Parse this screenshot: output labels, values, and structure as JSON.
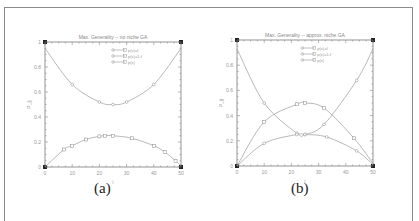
{
  "chart_data": [
    {
      "type": "line",
      "panel_label": "(a)",
      "title": "Max. Generality -- no niche GA",
      "xlabel": "t",
      "ylabel": "P_ij",
      "xlim": [
        0,
        50
      ],
      "ylim": [
        0,
        1
      ],
      "xticks": [
        0,
        10,
        20,
        30,
        40,
        50
      ],
      "yticks": [
        0,
        0.2,
        0.4,
        0.6,
        0.8,
        1
      ],
      "legend": [
        "p(x)=f",
        "p(x)=1-f",
        "p(x)"
      ],
      "series": [
        {
          "name": "upper curve",
          "marker": "circle",
          "x": [
            0,
            10,
            20,
            25,
            30,
            40,
            50
          ],
          "y": [
            0.95,
            0.66,
            0.52,
            0.5,
            0.52,
            0.66,
            0.95
          ]
        },
        {
          "name": "lower curve",
          "marker": "square",
          "x": [
            0,
            7,
            10,
            15,
            20,
            22,
            25,
            32,
            40,
            44,
            48,
            50
          ],
          "y": [
            0,
            0.14,
            0.17,
            0.22,
            0.245,
            0.25,
            0.25,
            0.23,
            0.17,
            0.12,
            0.05,
            0.01
          ]
        }
      ]
    },
    {
      "type": "line",
      "panel_label": "(b)",
      "title": "Max. Generality -- approx. niche GA",
      "xlabel": "t",
      "ylabel": "P_ij",
      "xlim": [
        0,
        50
      ],
      "ylim": [
        0,
        1
      ],
      "xticks": [
        0,
        10,
        20,
        30,
        40,
        50
      ],
      "yticks": [
        0,
        0.2,
        0.4,
        0.6,
        0.8,
        1
      ],
      "legend": [
        "p(x)=f",
        "p(x)=1-f",
        "p(x)"
      ],
      "series": [
        {
          "name": "U-shaped curve",
          "marker": "circle",
          "x": [
            0,
            10,
            22,
            25,
            32,
            44,
            50
          ],
          "y": [
            0.93,
            0.5,
            0.26,
            0.25,
            0.33,
            0.68,
            0.93
          ]
        },
        {
          "name": "arch curve",
          "marker": "square",
          "x": [
            0,
            10,
            22,
            25,
            32,
            43,
            50
          ],
          "y": [
            0,
            0.35,
            0.49,
            0.5,
            0.46,
            0.22,
            0.02
          ]
        },
        {
          "name": "lower arch",
          "marker": "triangle",
          "x": [
            0,
            10,
            22,
            25,
            33,
            44,
            50
          ],
          "y": [
            0,
            0.18,
            0.25,
            0.25,
            0.23,
            0.12,
            0.01
          ]
        }
      ]
    }
  ],
  "captions": {
    "a": "(a)",
    "b": "(b)"
  },
  "titles": {
    "a": "Max. Generality -- no niche GA",
    "b": "Max. Generality -- approx. niche GA"
  },
  "legend_labels": [
    "p(x)=f",
    "p(x)=1-f",
    "p(x)"
  ],
  "ytick_labels": [
    "0",
    "0.2",
    "0.4",
    "0.6",
    "0.8",
    "1"
  ],
  "xtick_labels": [
    "0",
    "10",
    "20",
    "30",
    "40",
    "50"
  ],
  "ylabel": "P_ij",
  "xlabel": "t"
}
